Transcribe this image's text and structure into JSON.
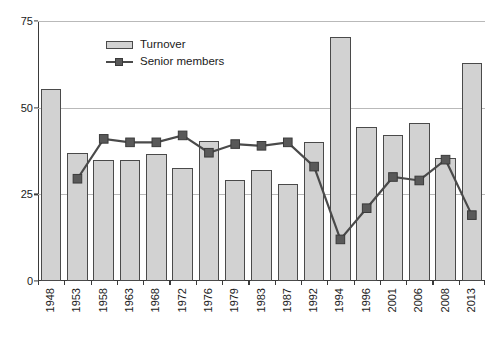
{
  "chart_data": {
    "type": "bar",
    "title": "",
    "subtitle": "",
    "xlabel": "",
    "ylabel": "",
    "ylim": [
      0,
      75
    ],
    "yticks": [
      0,
      25,
      50,
      75
    ],
    "grid": true,
    "legend_position": "top-center",
    "categories": [
      "1948",
      "1953",
      "1958",
      "1963",
      "1968",
      "1972",
      "1976",
      "1979",
      "1983",
      "1987",
      "1992",
      "1994",
      "1996",
      "2001",
      "2006",
      "2008",
      "2013"
    ],
    "series": [
      {
        "name": "Turnover",
        "type": "bar",
        "color": "#d2d2d2",
        "edge_color": "#4a4a4a",
        "values": [
          55.5,
          37,
          35,
          35,
          36.5,
          32.5,
          40.5,
          29,
          32,
          28,
          40,
          70.5,
          44.5,
          42,
          45.5,
          35.5,
          63
        ]
      },
      {
        "name": "Senior members",
        "type": "line",
        "color": "#4a4a4a",
        "marker": "square",
        "marker_color": "#595959",
        "values": [
          null,
          29.5,
          41,
          40,
          40,
          42,
          37,
          39.5,
          39,
          40,
          33,
          12,
          21,
          30,
          29,
          35,
          19
        ]
      }
    ]
  },
  "legend": {
    "items": [
      {
        "label": "Turnover",
        "icon": "bar-swatch"
      },
      {
        "label": "Senior members",
        "icon": "line-marker-swatch"
      }
    ]
  },
  "axes": {
    "y_tick_labels": [
      "75",
      "50",
      "25",
      "0"
    ],
    "x_tick_labels": [
      "1948",
      "1953",
      "1958",
      "1963",
      "1968",
      "1972",
      "1976",
      "1979",
      "1983",
      "1987",
      "1992",
      "1994",
      "1996",
      "2001",
      "2006",
      "2008",
      "2013"
    ]
  }
}
